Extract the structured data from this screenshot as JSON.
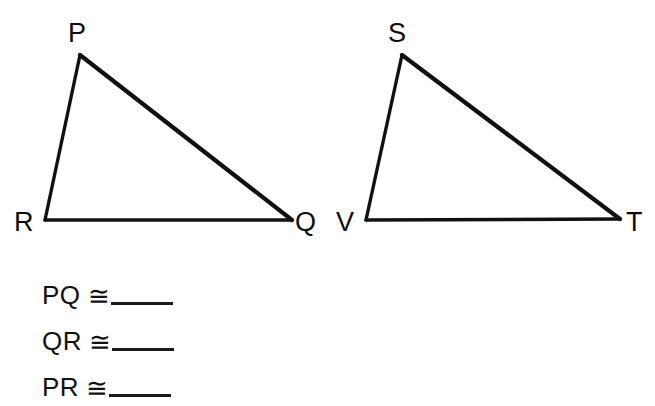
{
  "figure": {
    "type": "geometry-diagram",
    "stroke_color": "#111111",
    "background_color": "#ffffff",
    "triangles": [
      {
        "name": "triangle-PQR",
        "vertices": [
          {
            "label": "P",
            "x": 80,
            "y": 55,
            "label_x": 68,
            "label_y": 20
          },
          {
            "label": "Q",
            "x": 292,
            "y": 220,
            "label_x": 295,
            "label_y": 209
          },
          {
            "label": "R",
            "x": 45,
            "y": 220,
            "label_x": 14,
            "label_y": 209
          }
        ],
        "edges": [
          {
            "name": "edge-PQ",
            "from": "P",
            "to": "Q",
            "width": 4
          },
          {
            "name": "edge-QR",
            "from": "Q",
            "to": "R",
            "width": 3.5
          },
          {
            "name": "edge-PR",
            "from": "P",
            "to": "R",
            "width": 3.5
          }
        ]
      },
      {
        "name": "triangle-SVT",
        "vertices": [
          {
            "label": "S",
            "x": 402,
            "y": 55,
            "label_x": 388,
            "label_y": 20
          },
          {
            "label": "T",
            "x": 620,
            "y": 219,
            "label_x": 626,
            "label_y": 209
          },
          {
            "label": "V",
            "x": 366,
            "y": 220,
            "label_x": 336,
            "label_y": 209
          }
        ],
        "edges": [
          {
            "name": "edge-ST",
            "from": "S",
            "to": "T",
            "width": 4
          },
          {
            "name": "edge-TV",
            "from": "T",
            "to": "V",
            "width": 3.5
          },
          {
            "name": "edge-SV",
            "from": "S",
            "to": "V",
            "width": 3.5
          }
        ]
      }
    ]
  },
  "statements": {
    "congruence_symbol": "≅",
    "items": [
      {
        "segment": "PQ",
        "symbol": "≅",
        "answer": ""
      },
      {
        "segment": "QR",
        "symbol": "≅",
        "answer": ""
      },
      {
        "segment": "PR",
        "symbol": "≅",
        "answer": ""
      }
    ]
  }
}
